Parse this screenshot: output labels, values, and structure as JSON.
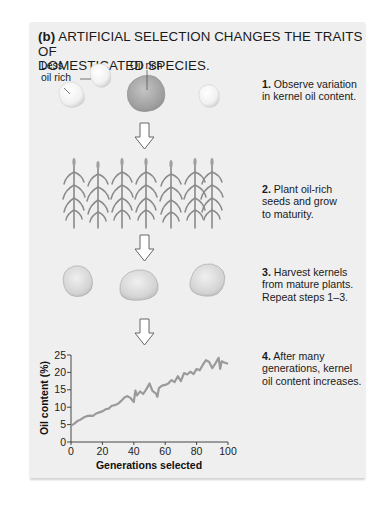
{
  "figure": {
    "title_prefix": "(b)",
    "title_line1": "ARTIFICIAL SELECTION CHANGES THE TRAITS OF",
    "title_line2": "DOMESTICATED SPECIES.",
    "kernel_labels": {
      "less_line1": "Less",
      "less_line2": "oil rich",
      "oil_rich": "Oil rich"
    },
    "steps": [
      {
        "num": "1.",
        "lines": [
          "Observe variation",
          "in kernel oil content."
        ]
      },
      {
        "num": "2.",
        "lines": [
          "Plant oil-rich",
          "seeds and grow",
          "to maturity."
        ]
      },
      {
        "num": "3.",
        "lines": [
          "Harvest kernels",
          "from mature plants.",
          "Repeat steps 1–3."
        ]
      },
      {
        "num": "4.",
        "lines": [
          "After many",
          "generations, kernel",
          "oil content increases."
        ]
      }
    ],
    "colors": {
      "panel_bg": "#efefef",
      "line": "#9a9a9a",
      "kernel_oil_rich": "#a8a8a8",
      "kernel_pale": "#f4f4f4",
      "plant": "#8a8a8a"
    }
  },
  "chart_data": {
    "type": "line",
    "title": "",
    "xlabel": "Generations selected",
    "ylabel": "Oil content (%)",
    "xlim": [
      0,
      100
    ],
    "ylim": [
      0,
      25
    ],
    "xticks": [
      "0",
      "20",
      "40",
      "60",
      "80",
      "100"
    ],
    "yticks": [
      "0",
      "5",
      "10",
      "15",
      "20",
      "25"
    ],
    "grid": false,
    "legend": "none",
    "series": [
      {
        "name": "Kernel oil content",
        "x": [
          0,
          2,
          4,
          6,
          8,
          10,
          12,
          14,
          16,
          18,
          20,
          22,
          24,
          26,
          28,
          30,
          32,
          34,
          36,
          38,
          40,
          41,
          42,
          44,
          46,
          48,
          50,
          52,
          54,
          55,
          56,
          58,
          60,
          62,
          64,
          66,
          68,
          70,
          72,
          74,
          76,
          78,
          80,
          82,
          84,
          86,
          88,
          90,
          92,
          94,
          95,
          96,
          98,
          100
        ],
        "values": [
          4.7,
          5.2,
          6.0,
          6.4,
          7.0,
          7.4,
          7.6,
          7.5,
          8.2,
          8.5,
          8.8,
          9.4,
          9.6,
          10.4,
          10.6,
          11.0,
          11.8,
          12.8,
          13.2,
          12.6,
          11.5,
          14.8,
          13.4,
          14.5,
          13.8,
          15.2,
          16.8,
          14.6,
          14.0,
          13.0,
          15.5,
          16.2,
          16.4,
          16.8,
          17.8,
          17.2,
          18.9,
          17.5,
          19.8,
          19.4,
          20.2,
          19.5,
          21.0,
          20.6,
          22.2,
          23.5,
          23.0,
          21.2,
          22.6,
          24.2,
          21.0,
          23.2,
          22.8,
          22.5
        ]
      }
    ]
  }
}
